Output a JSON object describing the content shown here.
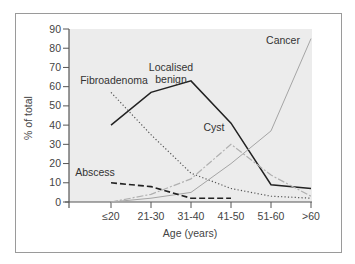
{
  "chart_data": {
    "type": "line",
    "title": "",
    "xlabel": "Age (years)",
    "ylabel": "% of total",
    "ylim": [
      0,
      90
    ],
    "yticks": [
      0,
      10,
      20,
      30,
      40,
      50,
      60,
      70,
      80,
      90
    ],
    "categories": [
      "≤20",
      "21-30",
      "31-40",
      "41-50",
      "51-60",
      ">60"
    ],
    "grid": false,
    "legend": "inline labels",
    "series": [
      {
        "name": "Localised benign",
        "label_lines": [
          "Localised",
          "benign"
        ],
        "style": "solid",
        "color": "#222222",
        "values": [
          40,
          57,
          63,
          41,
          9,
          7
        ]
      },
      {
        "name": "Fibroadenoma",
        "label_lines": [
          "Fibroadenoma"
        ],
        "style": "dotted",
        "color": "#666666",
        "values": [
          57,
          35,
          15,
          7,
          3,
          2
        ]
      },
      {
        "name": "Cancer",
        "label_lines": [
          "Cancer"
        ],
        "style": "solid-thin",
        "color": "#a8a8a8",
        "values": [
          0,
          2,
          5,
          20,
          37,
          85
        ]
      },
      {
        "name": "Cyst",
        "label_lines": [
          "Cyst"
        ],
        "style": "dash-dot",
        "color": "#b0b0b0",
        "values": [
          0,
          4,
          12,
          30,
          14,
          3
        ]
      },
      {
        "name": "Abscess",
        "label_lines": [
          "Abscess"
        ],
        "style": "dashed",
        "color": "#222222",
        "values": [
          10,
          8,
          2,
          2,
          null,
          null
        ]
      }
    ]
  },
  "colors": {
    "plot_background": "#ececec",
    "frame": "#9a9a9a",
    "axis": "#555555"
  }
}
